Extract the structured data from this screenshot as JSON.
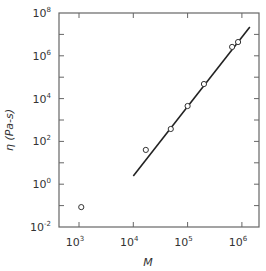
{
  "chart_data": {
    "type": "scatter",
    "title": "",
    "xlabel": "M",
    "ylabel": "η (Pa-s)",
    "xscale": "log",
    "yscale": "log",
    "xlim": [
      400,
      2000000
    ],
    "ylim": [
      0.01,
      100000000
    ],
    "grid": false,
    "legend": null,
    "x_ticks": [
      {
        "value": 1000,
        "base": "10",
        "exp": "3"
      },
      {
        "value": 10000,
        "base": "10",
        "exp": "4"
      },
      {
        "value": 100000,
        "base": "10",
        "exp": "5"
      },
      {
        "value": 1000000,
        "base": "10",
        "exp": "6"
      }
    ],
    "y_ticks": [
      {
        "value": 100000000,
        "base": "10",
        "exp": "8"
      },
      {
        "value": 1000000,
        "base": "10",
        "exp": "6"
      },
      {
        "value": 10000,
        "base": "10",
        "exp": "4"
      },
      {
        "value": 100,
        "base": "10",
        "exp": "2"
      },
      {
        "value": 1,
        "base": "10",
        "exp": "0"
      },
      {
        "value": 0.01,
        "base": "10",
        "exp": "-2"
      }
    ],
    "series": [
      {
        "name": "measured",
        "marker": "open-circle",
        "x": [
          1100,
          17000,
          49000,
          100000,
          200000,
          660000,
          850000
        ],
        "y": [
          0.085,
          40,
          380,
          4500,
          48000,
          2600000,
          4400000
        ]
      },
      {
        "name": "fit-line",
        "style": "line",
        "x": [
          10000,
          1400000
        ],
        "y": [
          2.4,
          22000000
        ]
      }
    ],
    "colors": {
      "axis": "#555555",
      "line": "#222222",
      "marker": "#333333"
    }
  }
}
